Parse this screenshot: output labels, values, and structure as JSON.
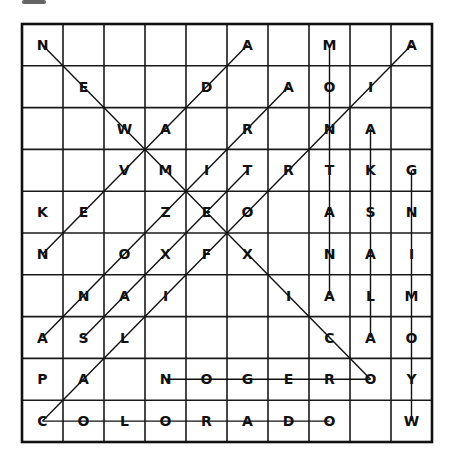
{
  "puzzle": {
    "type": "word-search",
    "rows": 10,
    "cols": 10,
    "grid": [
      [
        "N",
        "",
        "",
        "",
        "",
        "A",
        "",
        "M",
        "",
        "A"
      ],
      [
        "",
        "E",
        "",
        "",
        "D",
        "",
        "A",
        "O",
        "I",
        ""
      ],
      [
        "",
        "",
        "W",
        "A",
        "",
        "R",
        "",
        "N",
        "A",
        ""
      ],
      [
        "",
        "",
        "V",
        "M",
        "I",
        "T",
        "R",
        "T",
        "K",
        "G"
      ],
      [
        "K",
        "E",
        "",
        "Z",
        "E",
        "O",
        "",
        "A",
        "S",
        "N"
      ],
      [
        "N",
        "",
        "O",
        "X",
        "F",
        "X",
        "",
        "N",
        "A",
        "I"
      ],
      [
        "",
        "N",
        "A",
        "I",
        "",
        "",
        "I",
        "A",
        "L",
        "M"
      ],
      [
        "A",
        "S",
        "L",
        "",
        "",
        "",
        "",
        "C",
        "A",
        "O"
      ],
      [
        "P",
        "A",
        "",
        "N",
        "O",
        "G",
        "E",
        "R",
        "O",
        "Y"
      ],
      [
        "C",
        "O",
        "L",
        "O",
        "R",
        "A",
        "D",
        "O",
        "",
        "W"
      ]
    ],
    "found_words": [
      {
        "word": "NEW MEXICO",
        "start": [
          0,
          0
        ],
        "end": [
          8,
          8
        ]
      },
      {
        "word": "CALIFORNIA",
        "start": [
          9,
          0
        ],
        "end": [
          0,
          9
        ]
      },
      {
        "word": "NEVADA",
        "start": [
          5,
          0
        ],
        "end": [
          0,
          5
        ]
      },
      {
        "word": "ARIZONA",
        "start": [
          7,
          0
        ],
        "end": [
          1,
          6
        ]
      },
      {
        "word": "TEXAS",
        "start": [
          3,
          5
        ],
        "end": [
          7,
          1
        ]
      },
      {
        "word": "MONTANA",
        "start": [
          0,
          7
        ],
        "end": [
          6,
          7
        ]
      },
      {
        "word": "ALASKA",
        "start": [
          7,
          8
        ],
        "end": [
          2,
          8
        ]
      },
      {
        "word": "WYOMING",
        "start": [
          9,
          9
        ],
        "end": [
          3,
          9
        ]
      },
      {
        "word": "OREGON",
        "start": [
          8,
          8
        ],
        "end": [
          8,
          3
        ]
      },
      {
        "word": "COLORADO",
        "start": [
          9,
          0
        ],
        "end": [
          9,
          7
        ]
      }
    ]
  }
}
